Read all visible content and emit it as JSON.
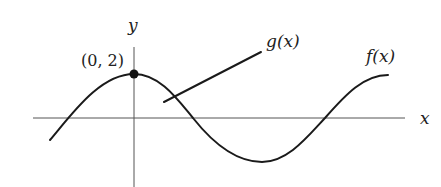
{
  "diagram": {
    "type": "function-graph",
    "axes": {
      "x_label": "x",
      "y_label": "y"
    },
    "point": {
      "label": "(0, 2)",
      "x": 0,
      "y": 2
    },
    "curves": [
      {
        "name": "f",
        "label": "f(x)",
        "shape": "cosine-like wave",
        "color": "#1a1a1a"
      },
      {
        "name": "g",
        "label": "g(x)",
        "shape": "line segment",
        "color": "#1a1a1a"
      }
    ]
  }
}
